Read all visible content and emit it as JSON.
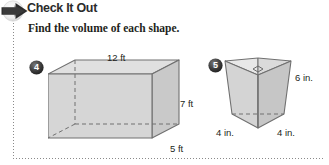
{
  "header": {
    "icon": "right-arrow-icon",
    "title": "Check It Out",
    "subtitle": "Find the volume of each shape."
  },
  "rules": {
    "left_vertical": "dotted-rule",
    "bottom_horizontal": "dotted-rule"
  },
  "problems": [
    {
      "number": "4",
      "shape": "rectangular-prism",
      "labels": {
        "length": "12 ft",
        "height": "7 ft",
        "depth": "5 ft"
      }
    },
    {
      "number": "5",
      "shape": "triangular-prism",
      "labels": {
        "height": "6 in.",
        "base_left": "4 in.",
        "base_right": "4 in."
      },
      "marks": "right-angle-mark"
    }
  ],
  "colors": {
    "face_light": "#dcdcdc",
    "face_mid": "#cfcfcf",
    "face_dark": "#c2c2c2",
    "outline": "#6f6f6f",
    "text": "#231f20",
    "badge": "#3b3b3b",
    "rule": "#8a8a8a"
  }
}
